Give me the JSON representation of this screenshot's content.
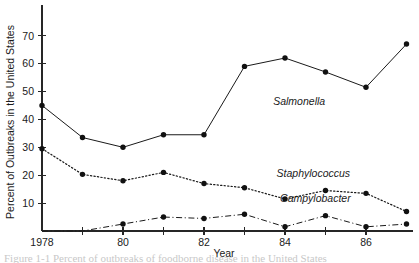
{
  "chart_data": {
    "type": "line",
    "title": "",
    "xlabel": "Year",
    "ylabel": "Percent of Outbreaks in the United States",
    "x": [
      1978,
      1979,
      1980,
      1981,
      1982,
      1983,
      1984,
      1985,
      1986,
      1987
    ],
    "xlim": [
      1978,
      1987
    ],
    "ylim": [
      0,
      75
    ],
    "grid": false,
    "legend_position": "inline-annotations",
    "x_tick_values": [
      1978,
      1979,
      1980,
      1981,
      1982,
      1983,
      1984,
      1985,
      1986
    ],
    "x_tick_labels": [
      "1978",
      "",
      "80",
      "",
      "82",
      "",
      "84",
      "",
      "86"
    ],
    "y_tick_values": [
      10,
      20,
      30,
      40,
      50,
      60,
      70
    ],
    "y_tick_labels": [
      "10",
      "20",
      "30",
      "40",
      "50",
      "60",
      "70"
    ],
    "series": [
      {
        "name": "Salmonella",
        "style": "solid",
        "label_x": 1984.35,
        "label_y": 45.0,
        "values": [
          45.0,
          33.5,
          30.0,
          34.5,
          34.5,
          59.0,
          62.0,
          57.0,
          51.5,
          67.0
        ]
      },
      {
        "name": "Staphylococcus",
        "style": "dotted",
        "label_x": 1984.7,
        "label_y": 19.5,
        "values": [
          29.5,
          20.3,
          18.0,
          21.0,
          17.0,
          15.5,
          11.5,
          14.5,
          13.5,
          7.0
        ]
      },
      {
        "name": "Campylobacter",
        "style": "dashdot",
        "label_x": 1984.75,
        "label_y": 10.5,
        "values": [
          0.0,
          0.0,
          2.5,
          5.0,
          4.5,
          6.0,
          1.5,
          5.5,
          1.5,
          2.5
        ]
      }
    ]
  },
  "caption": {
    "text": "Figure 1-1 Percent of outbreaks of foodborne disease in the United States"
  }
}
